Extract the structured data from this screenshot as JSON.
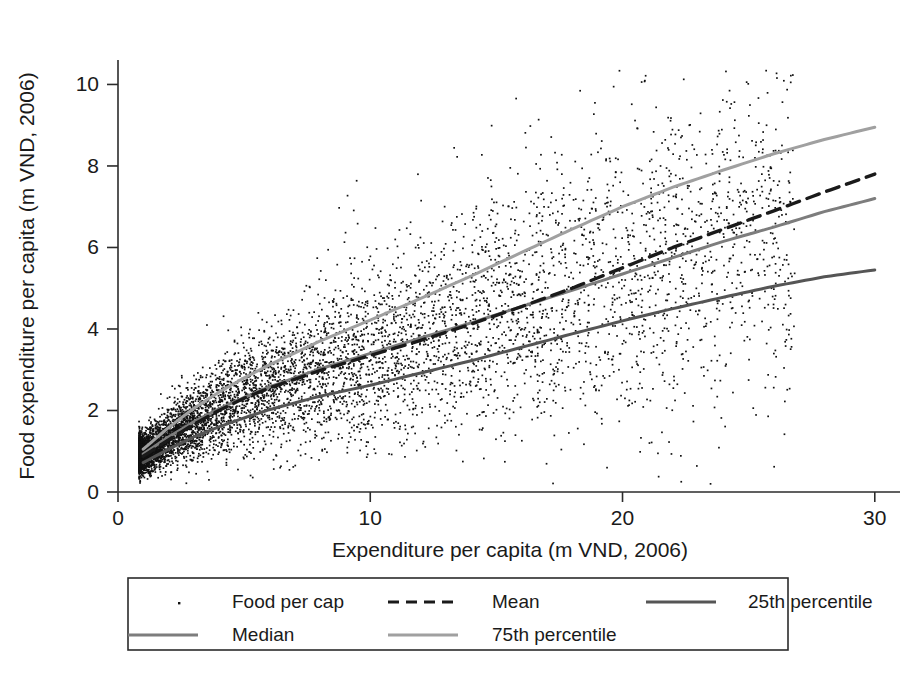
{
  "chart_data": {
    "type": "scatter",
    "title": "",
    "subtitle": "",
    "xlabel": "Expenditure per capita (m VND, 2006)",
    "ylabel": "Food expenditure per capita (m VND, 2006)",
    "xlim": [
      0,
      31
    ],
    "ylim": [
      0,
      10.6
    ],
    "xticks": [
      0,
      10,
      20,
      30
    ],
    "xtick_labels": [
      "0",
      "10",
      "20",
      "30"
    ],
    "yticks": [
      0,
      2,
      4,
      6,
      8,
      10
    ],
    "ytick_labels": [
      "0",
      "2",
      "4",
      "6",
      "8",
      "10"
    ],
    "grid": false,
    "legend_position": "below-axes",
    "legend_entries": [
      {
        "label": "Food per cap",
        "style": "marker",
        "color": "#111111"
      },
      {
        "label": "Mean",
        "style": "dashed",
        "color": "#1a1a1a"
      },
      {
        "label": "25th percentile",
        "style": "solid",
        "color": "#555555"
      },
      {
        "label": "Median",
        "style": "solid",
        "color": "#7d7d7d"
      },
      {
        "label": "75th percentile",
        "style": "solid",
        "color": "#a0a0a0"
      }
    ],
    "series": [
      {
        "name": "Food per cap",
        "type": "scatter",
        "marker": "point",
        "color": "#111111",
        "note": "dense cloud of household observations; density highest for x between 2 and 10"
      },
      {
        "name": "Mean",
        "type": "line",
        "dash": "dashed",
        "color": "#1a1a1a",
        "x": [
          1,
          2,
          3,
          4,
          5,
          6,
          8,
          10,
          12,
          14,
          16,
          18,
          20,
          22,
          24,
          26,
          28,
          30
        ],
        "y": [
          0.88,
          1.28,
          1.66,
          2.0,
          2.3,
          2.55,
          2.98,
          3.35,
          3.72,
          4.12,
          4.55,
          5.0,
          5.5,
          6.0,
          6.45,
          6.9,
          7.36,
          7.8
        ]
      },
      {
        "name": "Median",
        "type": "line",
        "dash": "solid",
        "color": "#7d7d7d",
        "x": [
          1,
          2,
          3,
          4,
          5,
          6,
          8,
          10,
          12,
          14,
          16,
          18,
          20,
          22,
          24,
          26,
          28,
          30
        ],
        "y": [
          0.93,
          1.35,
          1.72,
          2.04,
          2.32,
          2.58,
          3.02,
          3.4,
          3.78,
          4.15,
          4.55,
          4.95,
          5.35,
          5.75,
          6.15,
          6.5,
          6.88,
          7.2
        ]
      },
      {
        "name": "25th percentile",
        "type": "line",
        "dash": "solid",
        "color": "#555555",
        "x": [
          1,
          2,
          3,
          4,
          5,
          6,
          8,
          10,
          12,
          14,
          16,
          18,
          20,
          22,
          24,
          26,
          28,
          30
        ],
        "y": [
          0.72,
          1.05,
          1.35,
          1.6,
          1.82,
          2.02,
          2.35,
          2.62,
          2.92,
          3.22,
          3.55,
          3.88,
          4.2,
          4.5,
          4.78,
          5.05,
          5.28,
          5.45
        ]
      },
      {
        "name": "75th percentile",
        "type": "line",
        "dash": "solid",
        "color": "#a0a0a0",
        "x": [
          1,
          2,
          3,
          4,
          5,
          6,
          8,
          10,
          12,
          14,
          16,
          18,
          20,
          22,
          24,
          26,
          28,
          30
        ],
        "y": [
          1.05,
          1.58,
          2.05,
          2.45,
          2.8,
          3.12,
          3.7,
          4.22,
          4.75,
          5.3,
          5.88,
          6.45,
          7.0,
          7.48,
          7.9,
          8.3,
          8.65,
          8.95
        ]
      }
    ]
  }
}
